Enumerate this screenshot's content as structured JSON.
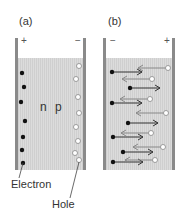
{
  "panels": [
    {
      "id": "a",
      "label": "(a)",
      "left_sign": "+",
      "right_sign": "−",
      "region_labels": [
        "n",
        "p"
      ],
      "electrons_y": [
        73,
        87,
        102,
        121,
        137,
        150,
        163
      ],
      "holes_y": [
        66,
        79,
        97,
        113,
        127,
        141,
        153,
        160
      ]
    },
    {
      "id": "b",
      "label": "(b)",
      "left_sign": "−",
      "right_sign": "+",
      "pairs": [
        {
          "electron_x": 112,
          "y_e": 72,
          "hole_x": 168,
          "y_h": 68
        },
        {
          "electron_x": 130,
          "y_e": 88,
          "hole_x": 152,
          "y_h": 79
        },
        {
          "electron_x": 112,
          "y_e": 103,
          "hole_x": 150,
          "y_h": 99
        },
        {
          "electron_x": 128,
          "y_e": 123,
          "hole_x": 166,
          "y_h": 113
        },
        {
          "electron_x": 113,
          "y_e": 137,
          "hole_x": 151,
          "y_h": 133
        },
        {
          "electron_x": 123,
          "y_e": 152,
          "hole_x": 163,
          "y_h": 147
        },
        {
          "electron_x": 113,
          "y_e": 162,
          "hole_x": 155,
          "y_h": 160
        }
      ]
    }
  ],
  "annotations": {
    "electron": "Electron",
    "hole": "Hole"
  },
  "colors": {
    "electrode": "#8a8a8a",
    "fill": "#d9d9d9",
    "electron": "#111111",
    "hole_stroke": "#888888",
    "arrow_dark": "#333333",
    "arrow_light": "#888888"
  }
}
